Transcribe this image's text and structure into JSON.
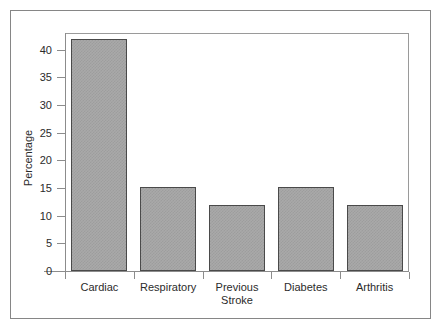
{
  "chart_data": {
    "type": "bar",
    "title": "",
    "subtitle": "",
    "xlabel": "",
    "ylabel": "Percentage",
    "categories": [
      "Cardiac",
      "Respiratory",
      "Previous Stroke",
      "Diabetes",
      "Arthritis"
    ],
    "category_lines": [
      [
        "Cardiac"
      ],
      [
        "Respiratory"
      ],
      [
        "Previous",
        "Stroke"
      ],
      [
        "Diabetes"
      ],
      [
        "Arthritis"
      ]
    ],
    "values": [
      42,
      15.2,
      12,
      15.1,
      12
    ],
    "ylim": [
      0,
      43
    ],
    "yticks": [
      0,
      5,
      10,
      15,
      20,
      25,
      30,
      35,
      40
    ],
    "ytick_labels": [
      "0",
      "5",
      "10",
      "15",
      "20",
      "25",
      "30",
      "35",
      "40"
    ],
    "grid": false,
    "legend": false,
    "legend_position": "none",
    "bar_fill_color": "#a9a9a9",
    "bar_edge_color": "#4a4a4a",
    "axis_color": "#8c8c8c",
    "panel_background": "#ffffff",
    "figure_background": "#ffffff",
    "border_color": "#868686",
    "text_color": "#2b2b2b"
  }
}
